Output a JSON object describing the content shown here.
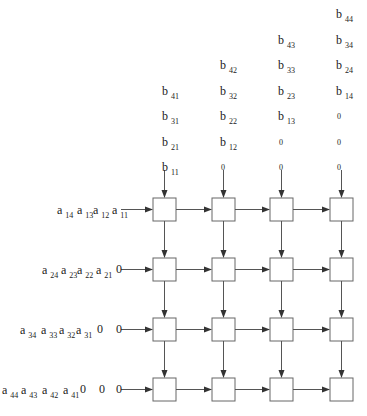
{
  "diagram": {
    "type": "systolic-array-matrix-multiplication",
    "grid": {
      "rows": 4,
      "cols": 4
    },
    "b_inputs": [
      {
        "column": 1,
        "stream_bottom_to_top": [
          "11",
          "21",
          "31",
          "41"
        ]
      },
      {
        "column": 2,
        "stream_bottom_to_top": [
          "0",
          "12",
          "22",
          "32",
          "42"
        ]
      },
      {
        "column": 3,
        "stream_bottom_to_top": [
          "0",
          "0",
          "13",
          "23",
          "33",
          "43"
        ]
      },
      {
        "column": 4,
        "stream_bottom_to_top": [
          "0",
          "0",
          "0",
          "14",
          "24",
          "34",
          "44"
        ]
      }
    ],
    "a_inputs": [
      {
        "row": 1,
        "stream_left_to_right": [
          "14",
          "13",
          "12",
          "11"
        ]
      },
      {
        "row": 2,
        "stream_left_to_right": [
          "24",
          "23",
          "22",
          "21",
          "0"
        ]
      },
      {
        "row": 3,
        "stream_left_to_right": [
          "34",
          "33",
          "32",
          "31",
          "0",
          "0"
        ]
      },
      {
        "row": 4,
        "stream_left_to_right": [
          "44",
          "43",
          "42",
          "41",
          "0",
          "0",
          "0"
        ]
      }
    ],
    "letters": {
      "a": "a",
      "b": "b",
      "zero": "0"
    },
    "colors": {
      "line": "#555555",
      "box": "#666666",
      "text": "#222222"
    }
  }
}
